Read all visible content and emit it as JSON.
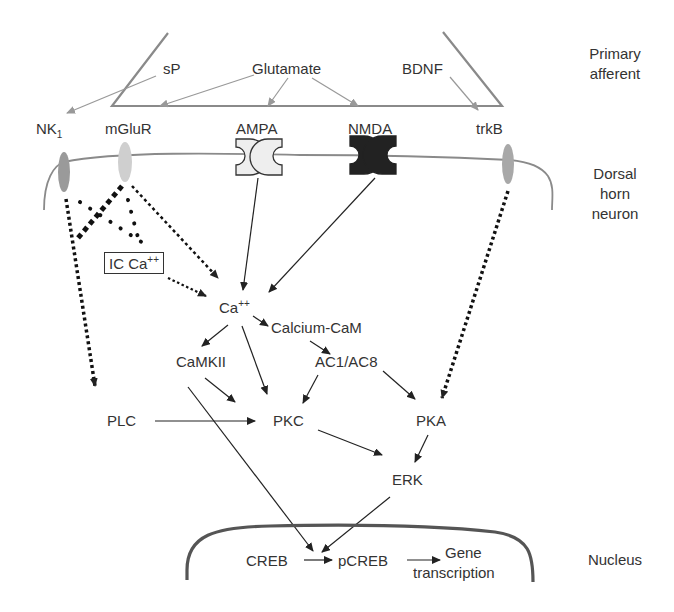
{
  "side_labels": {
    "primary_afferent": "Primary\nafferent",
    "dorsal_horn_neuron": "Dorsal\nhorn\nneuron",
    "nucleus": "Nucleus"
  },
  "ligands": {
    "sp": "sP",
    "glutamate": "Glutamate",
    "bdnf": "BDNF"
  },
  "receptors": {
    "nk1": "NK",
    "nk1_sub": "1",
    "mglur": "mGluR",
    "ampa": "AMPA",
    "nmda": "NMDA",
    "trkb": "trkB"
  },
  "intracellular": {
    "ic_ca": "IC Ca",
    "ic_ca_sup": "++",
    "ca": "Ca",
    "ca_sup": "++",
    "calcium_cam": "Calcium-CaM",
    "camkii": "CaMKII",
    "ac1_ac8": "AC1/AC8",
    "plc": "PLC",
    "pkc": "PKC",
    "pka": "PKA",
    "erk": "ERK"
  },
  "nuclear": {
    "creb": "CREB",
    "pcreb": "pCREB",
    "gene": "Gene",
    "transcription": "transcription"
  },
  "colors": {
    "membrane": "#8a8a8a",
    "arrow": "#222222",
    "ligand_arrow": "#999999",
    "nk1_fill": "#9a9a9a",
    "mglur_fill": "#cfcfcf",
    "trkb_fill": "#a8a8a8",
    "ampa_fill": "#eeeeee",
    "nmda_fill": "#222222",
    "nucleus_line": "#555555"
  }
}
